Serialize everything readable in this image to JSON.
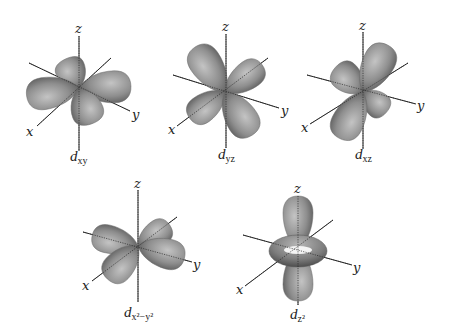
{
  "colors": {
    "background": "#ffffff",
    "lobe_highlight": "#c4c4c4",
    "lobe_mid": "#8e8e8e",
    "lobe_shadow": "#4e4e4e",
    "axis": "#2a2a2a"
  },
  "figures": [
    {
      "id": "dxy",
      "label": {
        "main": "d",
        "sub": "xy",
        "x": 70,
        "y": 161
      },
      "center": [
        79,
        88
      ],
      "axes": {
        "z": {
          "from": [
            79,
            36
          ],
          "to": [
            79,
            151
          ],
          "label": "z",
          "label_pos": [
            75,
            33
          ]
        },
        "x": {
          "from": [
            111,
            58
          ],
          "to": [
            37,
            126
          ],
          "label": "x",
          "label_pos": [
            26,
            136
          ]
        },
        "y": {
          "from": [
            29,
            63
          ],
          "to": [
            130,
            111
          ],
          "label": "y",
          "label_pos": [
            132,
            119
          ]
        }
      },
      "lobes": [
        {
          "name": "lobe-back-top",
          "angle": -115,
          "length": 32,
          "half_width": 15
        },
        {
          "name": "lobe-left",
          "angle": 171,
          "length": 53,
          "half_width": 16
        },
        {
          "name": "lobe-right",
          "angle": -2,
          "length": 52,
          "half_width": 16
        },
        {
          "name": "lobe-front-bottom",
          "angle": 70,
          "length": 38,
          "half_width": 16
        }
      ]
    },
    {
      "id": "dyz",
      "label": {
        "main": "d",
        "sub": "yz",
        "x": 218,
        "y": 159
      },
      "center": [
        225,
        92
      ],
      "axes": {
        "z": {
          "from": [
            226,
            34
          ],
          "to": [
            226,
            148
          ],
          "label": "z",
          "label_pos": [
            222,
            31
          ]
        },
        "x": {
          "from": [
            268,
            58
          ],
          "to": [
            177,
            126
          ],
          "label": "x",
          "label_pos": [
            168,
            134
          ]
        },
        "y": {
          "from": [
            173,
            75
          ],
          "to": [
            279,
            108
          ],
          "label": "y",
          "label_pos": [
            281,
            115
          ]
        }
      },
      "lobes": [
        {
          "name": "lobe-upper-right",
          "angle": -36,
          "length": 46,
          "half_width": 14
        },
        {
          "name": "lobe-upper-left",
          "angle": -124,
          "length": 54,
          "half_width": 16
        },
        {
          "name": "lobe-lower-left",
          "angle": 143,
          "length": 44,
          "half_width": 14
        },
        {
          "name": "lobe-lower-right",
          "angle": 58,
          "length": 51,
          "half_width": 16
        }
      ]
    },
    {
      "id": "dxz",
      "label": {
        "main": "d",
        "sub": "xz",
        "x": 355,
        "y": 159
      },
      "center": [
        363,
        92
      ],
      "axes": {
        "z": {
          "from": [
            363,
            32
          ],
          "to": [
            363,
            149
          ],
          "label": "z",
          "label_pos": [
            359,
            30
          ]
        },
        "x": {
          "from": [
            408,
            63
          ],
          "to": [
            310,
            124
          ],
          "label": "x",
          "label_pos": [
            301,
            132
          ]
        },
        "y": {
          "from": [
            307,
            75
          ],
          "to": [
            416,
            104
          ],
          "label": "y",
          "label_pos": [
            417,
            110
          ]
        }
      },
      "lobes": [
        {
          "name": "lobe-upper-left",
          "angle": -138,
          "length": 37,
          "half_width": 15
        },
        {
          "name": "lobe-upper-right",
          "angle": -62,
          "length": 53,
          "half_width": 16
        },
        {
          "name": "lobe-lower-right",
          "angle": 41,
          "length": 31,
          "half_width": 13
        },
        {
          "name": "lobe-lower-left",
          "angle": 117,
          "length": 52,
          "half_width": 16
        }
      ]
    },
    {
      "id": "dx2-y2",
      "label": {
        "main": "d",
        "sub": "x²−y²",
        "x": 124,
        "y": 317
      },
      "center": [
        138,
        246
      ],
      "axes": {
        "z": {
          "from": [
            138,
            190
          ],
          "to": [
            138,
            302
          ],
          "label": "z",
          "label_pos": [
            134,
            188
          ]
        },
        "x": {
          "from": [
            177,
            217
          ],
          "to": [
            92,
            281
          ],
          "label": "x",
          "label_pos": [
            82,
            290
          ]
        },
        "y": {
          "from": [
            83,
            232
          ],
          "to": [
            192,
            262
          ],
          "label": "y",
          "label_pos": [
            193,
            269
          ]
        }
      },
      "lobes": [
        {
          "name": "lobe-upper-right",
          "angle": -33,
          "length": 38,
          "half_width": 13
        },
        {
          "name": "lobe-left",
          "angle": -167,
          "length": 47,
          "half_width": 14
        },
        {
          "name": "lobe-right",
          "angle": 15,
          "length": 48,
          "half_width": 15
        },
        {
          "name": "lobe-lower-left",
          "angle": 133,
          "length": 45,
          "half_width": 15
        }
      ]
    },
    {
      "id": "dz2",
      "label": {
        "main": "d",
        "sub": "z²",
        "x": 290,
        "y": 319
      },
      "center": [
        298,
        249
      ],
      "axes": {
        "z": {
          "from": [
            298,
            196
          ],
          "to": [
            298,
            305
          ],
          "label": "z",
          "label_pos": [
            294,
            193
          ]
        },
        "x": {
          "from": [
            333,
            220
          ],
          "to": [
            245,
            286
          ],
          "label": "x",
          "label_pos": [
            236,
            294
          ]
        },
        "y": {
          "from": [
            243,
            235
          ],
          "to": [
            352,
            265
          ],
          "label": "y",
          "label_pos": [
            353,
            272
          ]
        }
      },
      "lobes": [
        {
          "name": "lobe-top",
          "angle": -90,
          "length": 53,
          "half_width": 15
        },
        {
          "name": "lobe-bottom",
          "angle": 90,
          "length": 52,
          "half_width": 15
        }
      ],
      "torus": {
        "cx": 298,
        "cy": 251,
        "rx": 29,
        "ry": 16,
        "hole_rx": 14,
        "hole_ry": 4
      }
    }
  ]
}
